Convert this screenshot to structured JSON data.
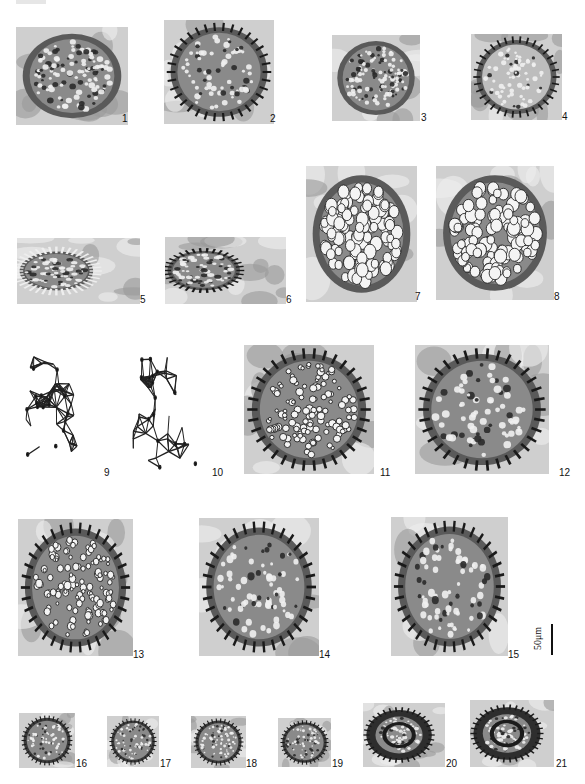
{
  "figure": {
    "type": "photomicrograph plate",
    "panel_count": 21,
    "panels": [
      {
        "id": "1",
        "label": "1",
        "style": "reticulate-dense"
      },
      {
        "id": "2",
        "label": "2",
        "style": "spiny-rim"
      },
      {
        "id": "3",
        "label": "3",
        "style": "reticulate-dense"
      },
      {
        "id": "4",
        "label": "4",
        "style": "spiny-rim-light"
      },
      {
        "id": "5",
        "label": "5",
        "style": "echinate"
      },
      {
        "id": "6",
        "label": "6",
        "style": "spiny-rim"
      },
      {
        "id": "7",
        "label": "7",
        "style": "reticulate-coarse"
      },
      {
        "id": "8",
        "label": "8",
        "style": "reticulate-coarse"
      },
      {
        "id": "9",
        "label": "9",
        "style": "line-drawing"
      },
      {
        "id": "10",
        "label": "10",
        "style": "line-drawing"
      },
      {
        "id": "11",
        "label": "11",
        "style": "reticulate-rim"
      },
      {
        "id": "12",
        "label": "12",
        "style": "spiny-rim"
      },
      {
        "id": "13",
        "label": "13",
        "style": "reticulate-rim"
      },
      {
        "id": "14",
        "label": "14",
        "style": "spiny-rim"
      },
      {
        "id": "15",
        "label": "15",
        "style": "spiny-rim"
      },
      {
        "id": "16",
        "label": "16",
        "style": "small-dark"
      },
      {
        "id": "17",
        "label": "17",
        "style": "small-dark"
      },
      {
        "id": "18",
        "label": "18",
        "style": "small-dark"
      },
      {
        "id": "19",
        "label": "19",
        "style": "small-dark"
      },
      {
        "id": "20",
        "label": "20",
        "style": "ring"
      },
      {
        "id": "21",
        "label": "21",
        "style": "ring"
      }
    ]
  },
  "scale_bar": {
    "label": "50μm",
    "value": 50,
    "unit": "μm"
  }
}
